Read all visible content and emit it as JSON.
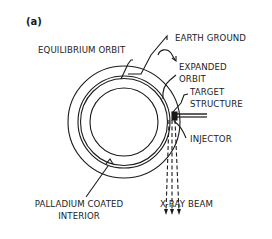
{
  "panel_label": "(a)",
  "labels": {
    "equilibrium_orbit": "EQUILIBRIUM ORBIT",
    "earth_ground": "EARTH GROUND",
    "expanded_orbit_line1": "EXPANDED",
    "expanded_orbit_line2": "ORBIT",
    "target_structure_line1": "TARGET",
    "target_structure_line2": "STRUCTURE",
    "injector": "INJECTOR",
    "palladium_line1": "PALLADIUM COATED",
    "palladium_line2": "INTERIOR",
    "xray_beam": "X-RAY BEAM"
  },
  "colors": {
    "stroke": "#1a1a1a",
    "background": "#ffffff"
  }
}
